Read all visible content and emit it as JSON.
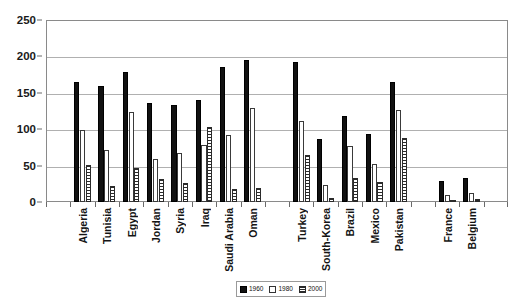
{
  "chart_data": {
    "type": "bar",
    "title": "",
    "subtitle": "",
    "xlabel": "",
    "ylabel": "",
    "ylim": [
      0,
      250
    ],
    "yticks": [
      0,
      50,
      100,
      150,
      200,
      250
    ],
    "grid": true,
    "legend_position": "bottom-right",
    "categories": [
      "Algeria",
      "Tunisia",
      "Egypt",
      "Jordan",
      "Syria",
      "Iraq",
      "Saudi Arabia",
      "Oman",
      "Turkey",
      "South-Korea",
      "Brazil",
      "Mexico",
      "Pakistan",
      "France",
      "Belgium"
    ],
    "series": [
      {
        "name": "1960",
        "values": [
          165,
          159,
          179,
          136,
          133,
          140,
          186,
          195,
          192,
          86,
          118,
          94,
          165,
          29,
          33
        ]
      },
      {
        "name": "1980",
        "values": [
          99,
          72,
          124,
          59,
          68,
          79,
          92,
          129,
          111,
          24,
          77,
          52,
          127,
          9,
          12
        ]
      },
      {
        "name": "2000",
        "values": [
          51,
          22,
          47,
          31,
          26,
          103,
          18,
          19,
          65,
          6,
          33,
          28,
          88,
          3,
          4
        ]
      }
    ],
    "group_breaks_after": [
      "Oman",
      "Pakistan"
    ],
    "colors": {
      "1960": "#111111",
      "1980": "#ffffff",
      "2000": "#2b2b2b",
      "gridline": "#b0b0b0",
      "axis": "#8a8a8a",
      "text": "#141414"
    }
  },
  "legend": {
    "items": [
      {
        "label": "1960",
        "swatch": "solid-black-swatch"
      },
      {
        "label": "1980",
        "swatch": "white-swatch"
      },
      {
        "label": "2000",
        "swatch": "hatched-swatch"
      }
    ]
  }
}
